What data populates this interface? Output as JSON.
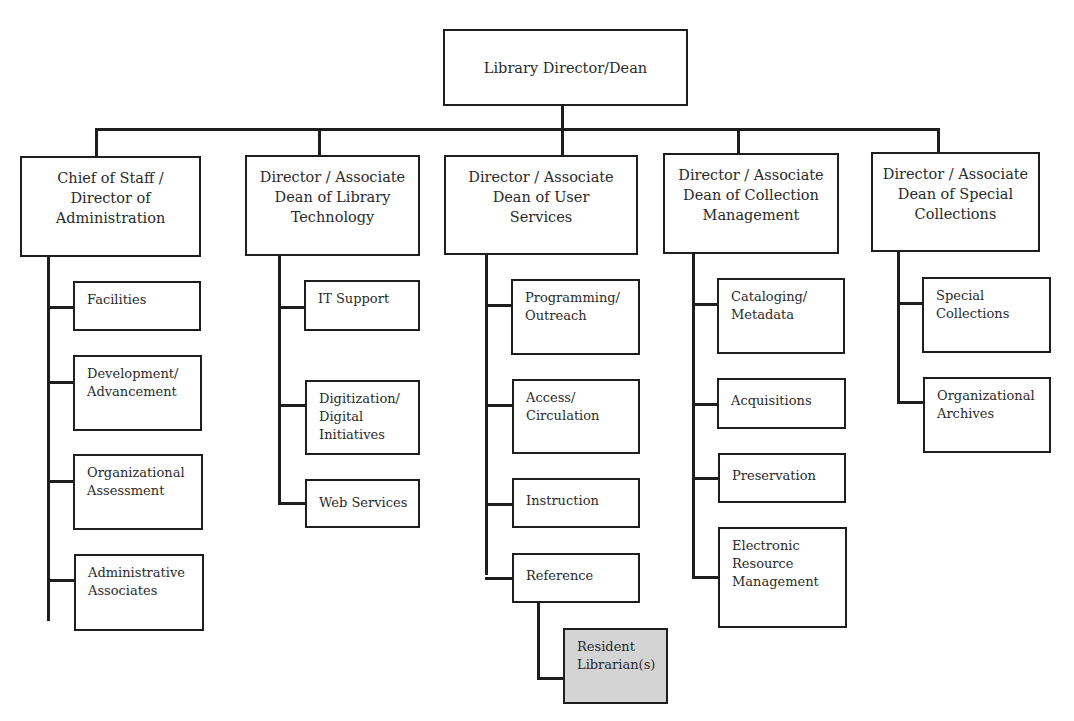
{
  "diagram": {
    "root": {
      "label": "Library Director/Dean"
    },
    "directors": [
      {
        "label": "Chief of Staff /\nDirector of\nAdministration",
        "children": [
          "Facilities",
          "Development/\nAdvancement",
          "Organizational\nAssessment",
          "Administrative\nAssociates"
        ]
      },
      {
        "label": "Director / Associate\nDean of Library\nTechnology",
        "children": [
          "IT Support",
          "Digitization/\nDigital\nInitiatives",
          "Web Services"
        ]
      },
      {
        "label": "Director / Associate\nDean of User\nServices",
        "children": [
          "Programming/\nOutreach",
          "Access/\nCirculation",
          "Instruction",
          "Reference"
        ],
        "sub_children": {
          "Reference": [
            "Resident\nLibrarian(s)"
          ]
        }
      },
      {
        "label": "Director / Associate\nDean of Collection\nManagement",
        "children": [
          "Cataloging/\nMetadata",
          "Acquisitions",
          "Preservation",
          "Electronic\nResource\nManagement"
        ]
      },
      {
        "label": "Director / Associate\nDean of Special\nCollections",
        "children": [
          "Special\nCollections",
          "Organizational\nArchives"
        ]
      }
    ],
    "highlight_color": "#d4d4d4"
  }
}
